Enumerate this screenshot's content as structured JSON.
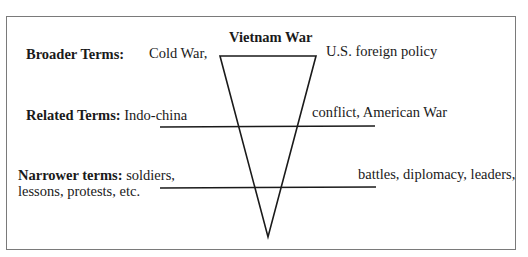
{
  "diagram": {
    "title": "Vietnam War",
    "broader": {
      "label": "Broader Terms:",
      "left_terms": "Cold War,",
      "right_terms": "U.S. foreign policy"
    },
    "related": {
      "label": "Related Terms:",
      "left_terms": "Indo-china",
      "right_terms": "conflict, American War"
    },
    "narrower": {
      "label": "Narrower terms:",
      "left_terms_line1": "soldiers,",
      "left_terms_line2": "lessons, protests, etc.",
      "right_terms": "battles, diplomacy, leaders,"
    },
    "colors": {
      "stroke": "#1a1a1a",
      "frame": "#7a7a7a",
      "background": "#ffffff"
    }
  }
}
